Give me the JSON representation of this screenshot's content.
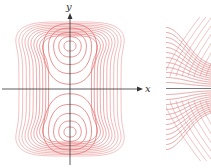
{
  "figure": {
    "left_panel": {
      "description": "Level curves of a function with two maxima on the y-axis and a saddle at the origin",
      "x_axis_label": "x",
      "y_axis_label": "y",
      "contour_color": "#e06060",
      "axis_color": "#333333",
      "contour_count": 14
    },
    "right_panel": {
      "description": "Close-up of level curves near the saddle point showing hyperbolic contours",
      "contour_color": "#e08080",
      "axis_color": "#555555"
    }
  }
}
